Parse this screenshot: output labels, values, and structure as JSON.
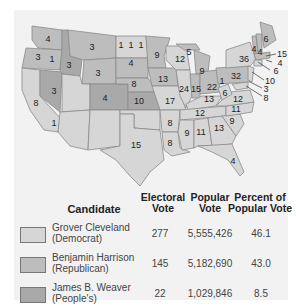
{
  "map": {
    "colors": {
      "democrat": "#d6d6d6",
      "republican": "#bdbdbd",
      "peoples": "#a9a9a9",
      "border": "#8a8a8a"
    },
    "state_votes": [
      {
        "state": "WA",
        "votes": "4"
      },
      {
        "state": "OR",
        "votes": "3"
      },
      {
        "state": "OR-split",
        "votes": "1"
      },
      {
        "state": "CA",
        "votes": "8"
      },
      {
        "state": "CA-split",
        "votes": "1"
      },
      {
        "state": "NV",
        "votes": "3"
      },
      {
        "state": "ID",
        "votes": "3"
      },
      {
        "state": "MT",
        "votes": "3"
      },
      {
        "state": "WY",
        "votes": "3"
      },
      {
        "state": "ND-1",
        "votes": "1"
      },
      {
        "state": "ND-2",
        "votes": "1"
      },
      {
        "state": "ND-3",
        "votes": "1"
      },
      {
        "state": "SD",
        "votes": "4"
      },
      {
        "state": "CO",
        "votes": "4"
      },
      {
        "state": "NE",
        "votes": "8"
      },
      {
        "state": "KS",
        "votes": "10"
      },
      {
        "state": "TX",
        "votes": "15"
      },
      {
        "state": "MN",
        "votes": "9"
      },
      {
        "state": "IA",
        "votes": "13"
      },
      {
        "state": "MO",
        "votes": "17"
      },
      {
        "state": "AR",
        "votes": "8"
      },
      {
        "state": "LA",
        "votes": "8"
      },
      {
        "state": "WI",
        "votes": "12"
      },
      {
        "state": "MI-north",
        "votes": "5"
      },
      {
        "state": "MI",
        "votes": "9"
      },
      {
        "state": "IL",
        "votes": "24"
      },
      {
        "state": "IN",
        "votes": "15"
      },
      {
        "state": "OH",
        "votes": "22"
      },
      {
        "state": "OH-split",
        "votes": "1"
      },
      {
        "state": "KY",
        "votes": "13"
      },
      {
        "state": "TN",
        "votes": "12"
      },
      {
        "state": "MS",
        "votes": "9"
      },
      {
        "state": "AL",
        "votes": "11"
      },
      {
        "state": "GA",
        "votes": "13"
      },
      {
        "state": "FL",
        "votes": "4"
      },
      {
        "state": "SC",
        "votes": "9"
      },
      {
        "state": "NC",
        "votes": "11"
      },
      {
        "state": "VA",
        "votes": "12"
      },
      {
        "state": "WV",
        "votes": "6"
      },
      {
        "state": "PA",
        "votes": "32"
      },
      {
        "state": "NY",
        "votes": "36"
      },
      {
        "state": "VT",
        "votes": "4"
      },
      {
        "state": "NH",
        "votes": "4"
      },
      {
        "state": "ME",
        "votes": "6"
      },
      {
        "state": "MA",
        "votes": "15"
      },
      {
        "state": "RI",
        "votes": "4"
      },
      {
        "state": "CT",
        "votes": "6"
      },
      {
        "state": "NJ",
        "votes": "10"
      },
      {
        "state": "DE",
        "votes": "3"
      },
      {
        "state": "MD",
        "votes": "8"
      }
    ]
  },
  "table": {
    "headers": {
      "candidate": "Candidate",
      "electoral_1": "Electoral",
      "electoral_2": "Vote",
      "popular_1": "Popular",
      "popular_2": "Vote",
      "percent_1": "Percent of",
      "percent_2": "Popular Vote"
    },
    "rows": [
      {
        "name": "Grover Cleveland",
        "party": "(Democrat)",
        "electoral": "277",
        "popular": "5,555,426",
        "percent": "46.1",
        "swatch": "#d6d6d6"
      },
      {
        "name": "Benjamin Harrison",
        "party": "(Republican)",
        "electoral": "145",
        "popular": "5,182,690",
        "percent": "43.0",
        "swatch": "#bdbdbd"
      },
      {
        "name": "James B. Weaver",
        "party": "(People's)",
        "electoral": "22",
        "popular": "1,029,846",
        "percent": "8.5",
        "swatch": "#a9a9a9"
      }
    ]
  }
}
